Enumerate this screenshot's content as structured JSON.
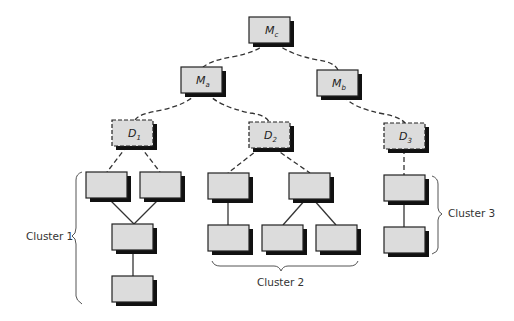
{
  "diagram": {
    "colors": {
      "box_fill": "#dcdcdc",
      "box_stroke": "#222222",
      "shadow": "#111111",
      "line": "#333333",
      "background": "#ffffff"
    },
    "nodes": {
      "mc": {
        "label": "M",
        "sub": "c",
        "type": "master"
      },
      "ma": {
        "label": "M",
        "sub": "a",
        "type": "master"
      },
      "mb": {
        "label": "M",
        "sub": "b",
        "type": "master"
      },
      "d1": {
        "label": "D",
        "sub": "1",
        "type": "dispatcher"
      },
      "d2": {
        "label": "D",
        "sub": "2",
        "type": "dispatcher"
      },
      "d3": {
        "label": "D",
        "sub": "3",
        "type": "dispatcher"
      }
    },
    "clusters": [
      {
        "id": "cluster1",
        "label": "Cluster 1",
        "node_count": 4
      },
      {
        "id": "cluster2",
        "label": "Cluster 2",
        "node_count": 5
      },
      {
        "id": "cluster3",
        "label": "Cluster 3",
        "node_count": 2
      }
    ],
    "edges": [
      {
        "from": "mc",
        "to": "ma",
        "style": "dashed"
      },
      {
        "from": "mc",
        "to": "mb",
        "style": "dashed"
      },
      {
        "from": "ma",
        "to": "d1",
        "style": "dashed"
      },
      {
        "from": "ma",
        "to": "d2",
        "style": "dashed"
      },
      {
        "from": "mb",
        "to": "d3",
        "style": "dashed"
      },
      {
        "from": "d1",
        "to": "c1n1",
        "style": "dashed"
      },
      {
        "from": "d1",
        "to": "c1n2",
        "style": "dashed"
      },
      {
        "from": "c1n1",
        "to": "c1n3",
        "style": "solid"
      },
      {
        "from": "c1n2",
        "to": "c1n3",
        "style": "solid"
      },
      {
        "from": "c1n3",
        "to": "c1n4",
        "style": "solid"
      },
      {
        "from": "d2",
        "to": "c2n1",
        "style": "dashed"
      },
      {
        "from": "d2",
        "to": "c2n2",
        "style": "dashed"
      },
      {
        "from": "c2n1",
        "to": "c2n3",
        "style": "solid"
      },
      {
        "from": "c2n2",
        "to": "c2n4",
        "style": "solid"
      },
      {
        "from": "c2n2",
        "to": "c2n5",
        "style": "solid"
      },
      {
        "from": "d3",
        "to": "c3n1",
        "style": "dashed"
      },
      {
        "from": "c3n1",
        "to": "c3n2",
        "style": "solid"
      }
    ]
  }
}
